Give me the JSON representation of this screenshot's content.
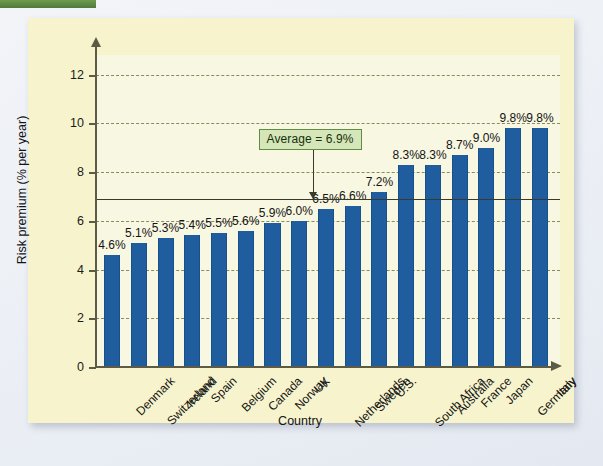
{
  "top_tab": {
    "color": "#5f8c44",
    "label": ""
  },
  "panel": {
    "background": "#f7f4cd",
    "plot_background": "#f8f7e2"
  },
  "colors": {
    "bar": "#1f5d9e",
    "axis": "#5b5b46",
    "grid": "#8a8a60",
    "average_line": "#3a3a2c",
    "callout_fill": "#d6e6b8",
    "callout_border": "#5f8c44"
  },
  "annotation": {
    "average_label": "Average = 6.9%",
    "average_value": 6.9
  },
  "chart_data": {
    "type": "bar",
    "title": "",
    "xlabel": "Country",
    "ylabel": "Risk premium (% per year)",
    "ylim": [
      0,
      12.8
    ],
    "yticks": [
      0,
      2,
      4,
      6,
      8,
      10,
      12
    ],
    "ytick_labels": [
      "0",
      "2",
      "4",
      "6",
      "8",
      "10",
      "12"
    ],
    "grid": true,
    "legend": "none",
    "categories": [
      "Denmark",
      "Switzerland",
      "Ireland",
      "Spain",
      "Belgium",
      "Canada",
      "Norway",
      "UK",
      "Netherlands",
      "Sweden",
      "U.S.",
      "South Africa",
      "Australia",
      "France",
      "Japan",
      "Germany",
      "Italy"
    ],
    "values": [
      4.6,
      5.1,
      5.3,
      5.4,
      5.5,
      5.6,
      5.9,
      6.0,
      6.5,
      6.6,
      7.2,
      8.3,
      8.3,
      8.7,
      9.0,
      9.8,
      9.8
    ],
    "data_labels": [
      "4.6%",
      "5.1%",
      "5.3%",
      "5.4%",
      "5.5%",
      "5.6%",
      "5.9%",
      "6.0%",
      "6.5%",
      "6.6%",
      "7.2%",
      "8.3%",
      "8.3%",
      "8.7%",
      "9.0%",
      "9.8%",
      "9.8%"
    ],
    "annotations": [
      {
        "text": "Average = 6.9%",
        "y": 6.9,
        "type": "hline-callout"
      }
    ]
  }
}
